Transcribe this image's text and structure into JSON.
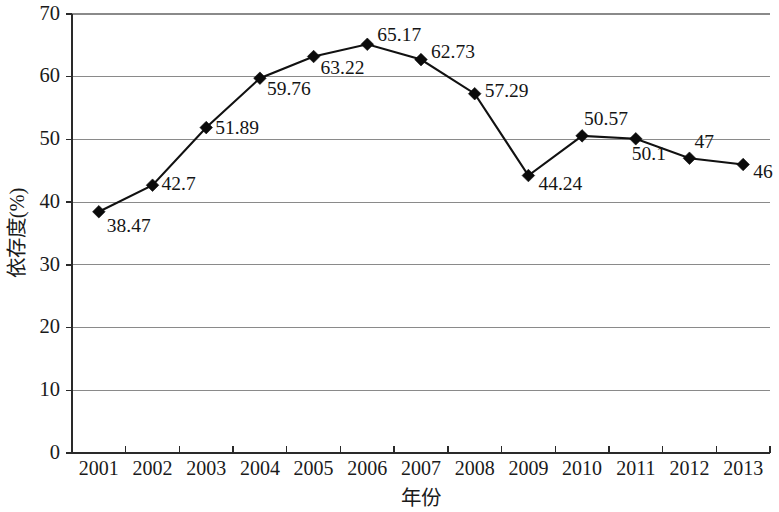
{
  "chart_data": {
    "type": "line",
    "title": "",
    "xlabel": "年份",
    "ylabel": "依存度(%)",
    "categories": [
      "2001",
      "2002",
      "2003",
      "2004",
      "2005",
      "2006",
      "2007",
      "2008",
      "2009",
      "2010",
      "2011",
      "2012",
      "2013"
    ],
    "values": [
      38.47,
      42.7,
      51.89,
      59.76,
      63.22,
      65.17,
      62.73,
      57.29,
      44.24,
      50.57,
      50.1,
      47,
      46
    ],
    "point_labels": [
      "38.47",
      "42.7",
      "51.89",
      "59.76",
      "63.22",
      "65.17",
      "62.73",
      "57.29",
      "44.24",
      "50.57",
      "50.1",
      "47",
      "46"
    ],
    "ylim": [
      0,
      70
    ],
    "yticks": [
      0,
      10,
      20,
      30,
      40,
      50,
      60,
      70
    ],
    "ytick_labels": [
      "0",
      "10",
      "20",
      "30",
      "40",
      "50",
      "60",
      "70"
    ],
    "grid": true,
    "grid_axis": "y",
    "legend": "none",
    "series_color": "#111111",
    "grid_color": "#8a8a8a",
    "axis_color": "#2a2a2a",
    "marker": "diamond",
    "background": "#ffffff"
  },
  "label_offsets": [
    {
      "dx": 8,
      "dy": 20,
      "anchor": "start"
    },
    {
      "dx": 9,
      "dy": 5,
      "anchor": "start"
    },
    {
      "dx": 9,
      "dy": 6,
      "anchor": "start"
    },
    {
      "dx": 7,
      "dy": 17,
      "anchor": "start"
    },
    {
      "dx": 7,
      "dy": 17,
      "anchor": "start"
    },
    {
      "dx": 10,
      "dy": -3,
      "anchor": "start"
    },
    {
      "dx": 10,
      "dy": -2,
      "anchor": "start"
    },
    {
      "dx": 10,
      "dy": 3,
      "anchor": "start"
    },
    {
      "dx": 10,
      "dy": 14,
      "anchor": "start"
    },
    {
      "dx": 2,
      "dy": -11,
      "anchor": "start"
    },
    {
      "dx": -4,
      "dy": 21,
      "anchor": "start"
    },
    {
      "dx": 5,
      "dy": -10,
      "anchor": "start"
    },
    {
      "dx": 10,
      "dy": 13,
      "anchor": "start"
    }
  ]
}
